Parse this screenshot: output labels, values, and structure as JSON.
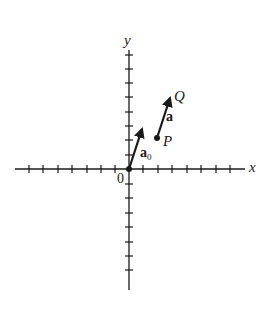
{
  "diagram": {
    "type": "vector-coordinate-plane",
    "axes": {
      "x_label": "x",
      "y_label": "y",
      "origin_label": "0",
      "tick_count_each_side": 7,
      "y_ticks_above": 8,
      "y_ticks_below": 7
    },
    "vectors": [
      {
        "name": "a0",
        "label_main": "a",
        "label_sub": "0",
        "from": "origin",
        "to": "tip",
        "style": "bold arrow"
      },
      {
        "name": "a",
        "label_main": "a",
        "from": "P",
        "to": "Q",
        "style": "bold arrow"
      }
    ],
    "points": [
      {
        "name": "P",
        "label": "P"
      },
      {
        "name": "Q",
        "label": "Q"
      }
    ],
    "colors": {
      "ink": "#1a1a1a",
      "background": "#ffffff"
    }
  }
}
